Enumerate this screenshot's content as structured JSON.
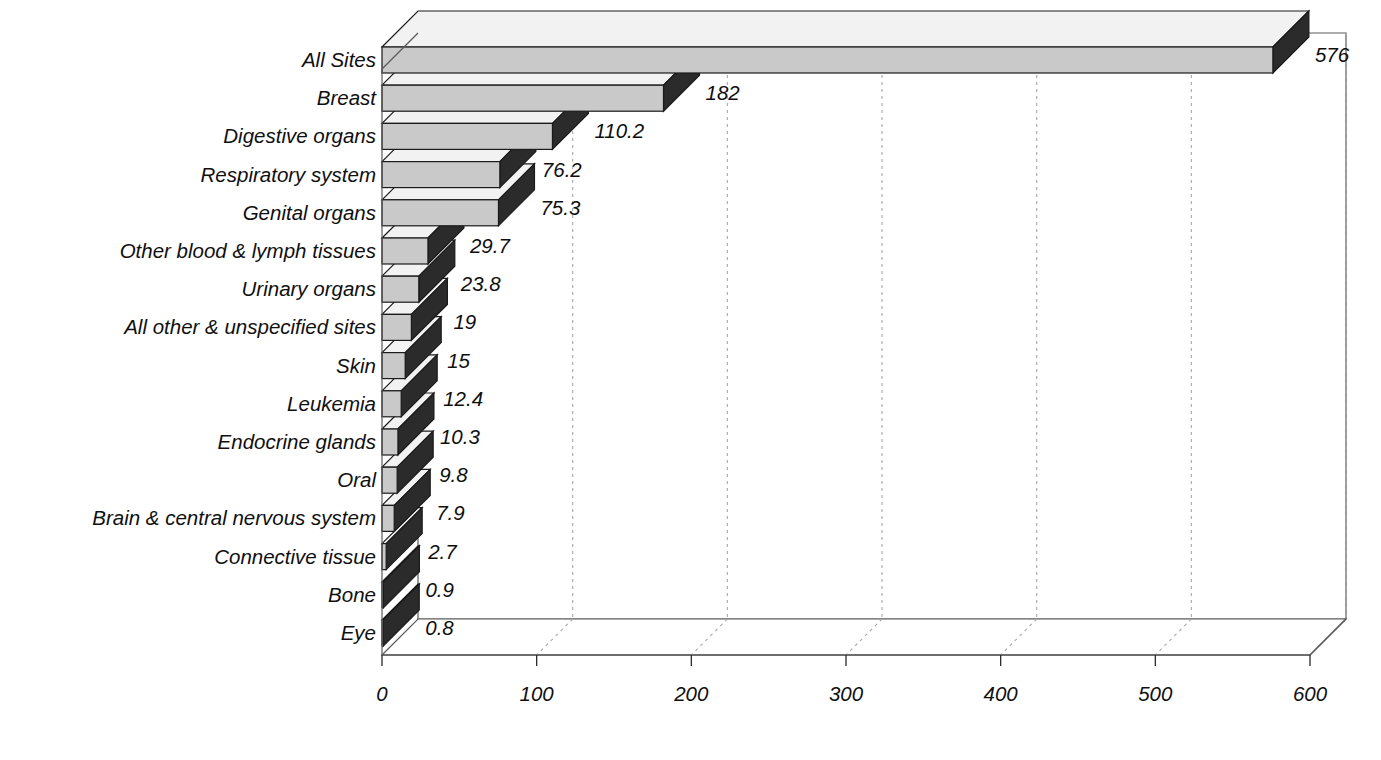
{
  "chart_data": {
    "type": "bar",
    "orientation": "horizontal",
    "style": "3d-bar",
    "title": "",
    "xlabel": "",
    "ylabel": "",
    "categories": [
      "All Sites",
      "Breast",
      "Digestive organs",
      "Respiratory system",
      "Genital organs",
      "Other blood & lymph tissues",
      "Urinary organs",
      "All other & unspecified sites",
      "Skin",
      "Leukemia",
      "Endocrine glands",
      "Oral",
      "Brain & central nervous system",
      "Connective tissue",
      "Bone",
      "Eye"
    ],
    "values": [
      576,
      182,
      110.2,
      76.2,
      75.3,
      29.7,
      23.8,
      19,
      15,
      12.4,
      10.3,
      9.8,
      7.9,
      2.7,
      0.9,
      0.8
    ],
    "value_labels": [
      "576",
      "182",
      "110.2",
      "76.2",
      "75.3",
      "29.7",
      "23.8",
      "19",
      "15",
      "12.4",
      "10.3",
      "9.8",
      "7.9",
      "2.7",
      "0.9",
      "0.8"
    ],
    "xlim": [
      0,
      600
    ],
    "xticks": [
      0,
      100,
      200,
      300,
      400,
      500,
      600
    ],
    "xtick_labels": [
      "0",
      "100",
      "200",
      "300",
      "400",
      "500",
      "600"
    ],
    "grid": true,
    "grid_style": "dashed-vertical",
    "legend": "none"
  },
  "colors": {
    "bar_front": "#c9c9c9",
    "bar_side": "#2b2b2b",
    "bar_top": "#f2f2f2",
    "outline": "#1a1a1a",
    "wall": "#ffffff",
    "wall_edge": "#5a5a5a",
    "grid": "#a8a8a8",
    "text": "#101010",
    "background": "#ffffff"
  }
}
